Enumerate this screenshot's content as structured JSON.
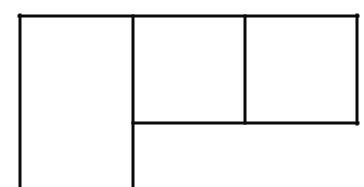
{
  "diagram": {
    "type": "floor-plan-outline",
    "background": "#ffffff",
    "stroke_color": "#0a0a0a",
    "stroke_width": 3,
    "lines": [
      {
        "name": "top-edge",
        "x1": 19,
        "y1": 16,
        "x2": 358,
        "y2": 16
      },
      {
        "name": "left-edge",
        "x1": 20,
        "y1": 15,
        "x2": 20,
        "y2": 187
      },
      {
        "name": "divider-vertical-1",
        "x1": 133,
        "y1": 16,
        "x2": 133,
        "y2": 187
      },
      {
        "name": "divider-vertical-2",
        "x1": 245,
        "y1": 16,
        "x2": 245,
        "y2": 123
      },
      {
        "name": "right-edge",
        "x1": 357,
        "y1": 15,
        "x2": 357,
        "y2": 124
      },
      {
        "name": "divider-horizontal",
        "x1": 133,
        "y1": 123,
        "x2": 358,
        "y2": 123
      }
    ],
    "regions": [
      {
        "name": "tall-left-panel"
      },
      {
        "name": "upper-middle-panel"
      },
      {
        "name": "upper-right-panel"
      },
      {
        "name": "lower-open-area"
      }
    ]
  }
}
